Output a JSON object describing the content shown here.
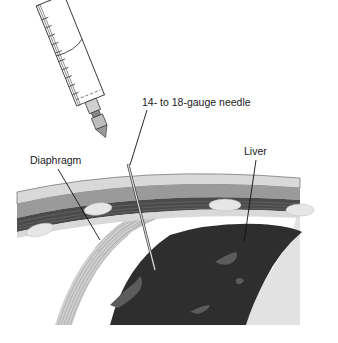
{
  "figure": {
    "labels": {
      "needle": "14- to 18-gauge needle",
      "diaphragm": "Diaphragm",
      "liver": "Liver"
    },
    "structures": [
      "syringe",
      "needle",
      "skin-layer",
      "subcutaneous-layer",
      "muscle-layer",
      "ribs",
      "diaphragm",
      "liver"
    ],
    "colors": {
      "skin": "#d9d9d9",
      "muscle": "#9a9a9a",
      "intercostal": "#4a4a4a",
      "rib": "#e6e6e6",
      "liver": "#2e2e2e",
      "liver_vessel": "#5c5c5c",
      "pleural_space": "#e2e2e2",
      "diaphragm": "#c8c8c8"
    }
  }
}
